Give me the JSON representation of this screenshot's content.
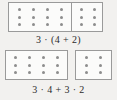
{
  "figure": {
    "kind": "distributive-property-dot-arrays",
    "dot_color": "#8d8d8d",
    "box_border_color": "#9a9a9a",
    "box_fill_color": "#fbfbfa",
    "background_color": "#f2f1ef",
    "text_color": "#2b2b2b"
  },
  "top": {
    "caption": "3 · (4 + 2)",
    "rows": 3,
    "groups": [
      {
        "name": "left-group",
        "columns": 4
      },
      {
        "name": "right-group",
        "columns": 2
      }
    ],
    "divider": "single vertical line inside one rectangle"
  },
  "bottom": {
    "caption": "3 · 4 + 3 · 2",
    "rows": 3,
    "boxes": [
      {
        "name": "left-box",
        "columns": 4
      },
      {
        "name": "right-box",
        "columns": 2
      }
    ]
  },
  "chart_data": {
    "type": "table",
    "series": [
      {
        "name": "3 · (4 + 2)",
        "rows": 3,
        "columns": [
          4,
          2
        ],
        "total_dots": 18,
        "value": 18
      },
      {
        "name": "3 · 4 + 3 · 2",
        "rows": 3,
        "columns": [
          4,
          2
        ],
        "total_dots": 18,
        "value": 18
      }
    ],
    "categories": [
      "3 · (4 + 2)",
      "3 · 4 + 3 · 2"
    ],
    "values": [
      18,
      18
    ],
    "xlabel": "",
    "ylabel": "",
    "grid": false,
    "legend": "none"
  }
}
